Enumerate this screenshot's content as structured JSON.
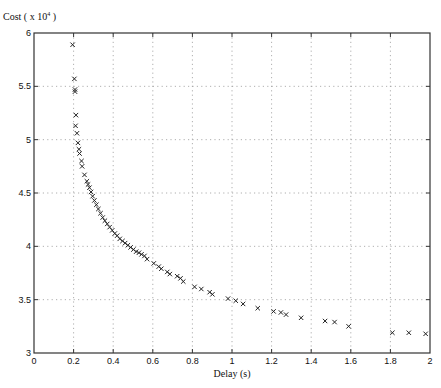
{
  "chart_data": {
    "type": "scatter",
    "title": "",
    "xlabel": "Delay (s)",
    "ylabel": "Cost ( x 10",
    "ylabel_exponent": "4",
    "ylabel_suffix": " )",
    "xlim": [
      0,
      2
    ],
    "ylim": [
      3,
      6
    ],
    "grid": true,
    "marker": "x",
    "x_ticks": [
      0,
      0.2,
      0.4,
      0.6,
      0.8,
      1,
      1.2,
      1.4,
      1.6,
      1.8,
      2
    ],
    "x_tick_labels": [
      "0",
      "0.2",
      "0.4",
      "0.6",
      "0.8",
      "1",
      "1.2",
      "1.4",
      "1.6",
      "1.8",
      "2"
    ],
    "y_ticks": [
      3,
      3.5,
      4,
      4.5,
      5,
      5.5,
      6
    ],
    "y_tick_labels": [
      "3",
      "3.5",
      "4",
      "4.5",
      "5",
      "5.5",
      "6"
    ],
    "series": [
      {
        "name": "Cost vs Delay",
        "points": [
          [
            0.195,
            5.89
          ],
          [
            0.204,
            5.57
          ],
          [
            0.207,
            5.47
          ],
          [
            0.207,
            5.45
          ],
          [
            0.212,
            5.23
          ],
          [
            0.21,
            5.13
          ],
          [
            0.217,
            5.06
          ],
          [
            0.222,
            4.97
          ],
          [
            0.227,
            4.91
          ],
          [
            0.23,
            4.87
          ],
          [
            0.24,
            4.8
          ],
          [
            0.243,
            4.75
          ],
          [
            0.255,
            4.67
          ],
          [
            0.267,
            4.61
          ],
          [
            0.273,
            4.58
          ],
          [
            0.28,
            4.55
          ],
          [
            0.288,
            4.51
          ],
          [
            0.296,
            4.47
          ],
          [
            0.305,
            4.43
          ],
          [
            0.315,
            4.39
          ],
          [
            0.325,
            4.35
          ],
          [
            0.336,
            4.31
          ],
          [
            0.347,
            4.27
          ],
          [
            0.358,
            4.24
          ],
          [
            0.37,
            4.21
          ],
          [
            0.382,
            4.18
          ],
          [
            0.395,
            4.15
          ],
          [
            0.408,
            4.12
          ],
          [
            0.42,
            4.1
          ],
          [
            0.433,
            4.07
          ],
          [
            0.447,
            4.05
          ],
          [
            0.46,
            4.03
          ],
          [
            0.474,
            4.01
          ],
          [
            0.488,
            3.99
          ],
          [
            0.502,
            3.97
          ],
          [
            0.516,
            3.95
          ],
          [
            0.53,
            3.94
          ],
          [
            0.543,
            3.925
          ],
          [
            0.558,
            3.91
          ],
          [
            0.571,
            3.88
          ],
          [
            0.605,
            3.84
          ],
          [
            0.63,
            3.81
          ],
          [
            0.643,
            3.79
          ],
          [
            0.673,
            3.76
          ],
          [
            0.686,
            3.74
          ],
          [
            0.723,
            3.72
          ],
          [
            0.74,
            3.7
          ],
          [
            0.754,
            3.67
          ],
          [
            0.811,
            3.62
          ],
          [
            0.845,
            3.6
          ],
          [
            0.887,
            3.57
          ],
          [
            0.901,
            3.55
          ],
          [
            0.98,
            3.51
          ],
          [
            1.019,
            3.49
          ],
          [
            1.056,
            3.46
          ],
          [
            1.13,
            3.42
          ],
          [
            1.21,
            3.39
          ],
          [
            1.247,
            3.38
          ],
          [
            1.273,
            3.36
          ],
          [
            1.349,
            3.33
          ],
          [
            1.47,
            3.3
          ],
          [
            1.518,
            3.29
          ],
          [
            1.589,
            3.25
          ],
          [
            1.81,
            3.19
          ],
          [
            1.893,
            3.19
          ],
          [
            1.978,
            3.18
          ]
        ]
      }
    ]
  },
  "layout": {
    "plot": {
      "left": 34,
      "top": 33,
      "right": 430,
      "bottom": 353
    },
    "colors": {
      "marker": "#222222",
      "grid": "#9a9a9a",
      "frame": "#333333",
      "background": "#ffffff"
    }
  }
}
